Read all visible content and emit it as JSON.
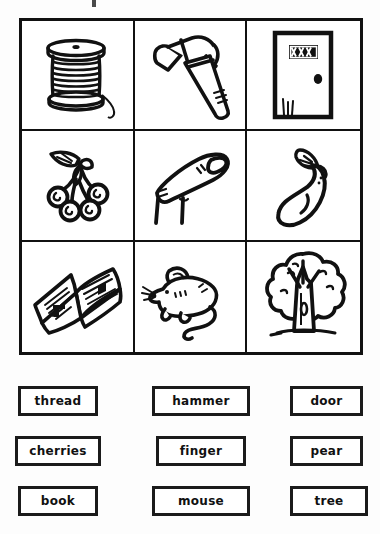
{
  "worksheet": {
    "type": "picture-word matching worksheet",
    "grid": {
      "rows": 3,
      "columns": 3,
      "cells": [
        {
          "position": "row1-col1",
          "icon": "thread-spool-icon",
          "label": "spool of thread"
        },
        {
          "position": "row1-col2",
          "icon": "hammer-icon",
          "label": "hammer"
        },
        {
          "position": "row1-col3",
          "icon": "door-icon",
          "label": "door"
        },
        {
          "position": "row2-col1",
          "icon": "cherries-icon",
          "label": "cherries"
        },
        {
          "position": "row2-col2",
          "icon": "finger-icon",
          "label": "finger"
        },
        {
          "position": "row2-col3",
          "icon": "pear-icon",
          "label": "pear"
        },
        {
          "position": "row3-col1",
          "icon": "open-book-icon",
          "label": "open book"
        },
        {
          "position": "row3-col2",
          "icon": "mouse-icon",
          "label": "mouse"
        },
        {
          "position": "row3-col3",
          "icon": "tree-icon",
          "label": "tree"
        }
      ]
    },
    "word_bank": {
      "rows": [
        [
          "thread",
          "hammer",
          "door"
        ],
        [
          "cherries",
          "finger",
          "pear"
        ],
        [
          "book",
          "mouse",
          "tree"
        ]
      ],
      "words": {
        "thread": "thread",
        "hammer": "hammer",
        "door": "door",
        "cherries": "cherries",
        "finger": "finger",
        "pear": "pear",
        "book": "book",
        "mouse": "mouse",
        "tree": "tree"
      }
    },
    "colors": {
      "ink": "#111111",
      "paper": "#fdfdfd",
      "cell_background": "#ffffff"
    }
  }
}
